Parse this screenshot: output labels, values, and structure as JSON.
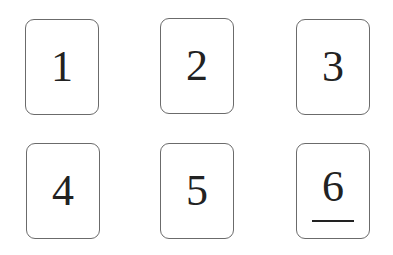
{
  "cards": [
    {
      "label": "1",
      "underlined": false
    },
    {
      "label": "2",
      "underlined": false
    },
    {
      "label": "3",
      "underlined": false
    },
    {
      "label": "4",
      "underlined": false
    },
    {
      "label": "5",
      "underlined": false
    },
    {
      "label": "6",
      "underlined": true
    }
  ],
  "colors": {
    "border": "#6b6b6b",
    "text": "#222222",
    "background": "#ffffff"
  }
}
